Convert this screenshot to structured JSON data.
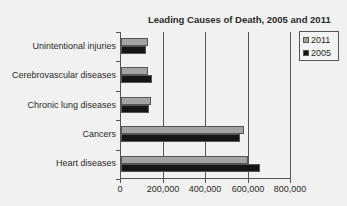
{
  "chart_data": {
    "type": "bar",
    "orientation": "horizontal",
    "title": "Leading Causes of Death, 2005 and 2011",
    "xlabel": "",
    "ylabel": "",
    "categories": [
      "Unintentional injuries",
      "Cerebrovascular diseases",
      "Chronic lung diseases",
      "Cancers",
      "Heart diseases"
    ],
    "series": [
      {
        "name": "2011",
        "color": "#a3a3a3",
        "values": [
          126000,
          129000,
          143000,
          577000,
          597000
        ]
      },
      {
        "name": "2005",
        "color": "#151515",
        "values": [
          118000,
          144000,
          131000,
          559000,
          652000
        ]
      }
    ],
    "xlim": [
      0,
      800000
    ],
    "x_ticks": [
      "0",
      "200,000",
      "400,000",
      "600,000",
      "800,000"
    ],
    "grid": "vertical",
    "legend_position": "top-right"
  },
  "legend": {
    "items": [
      {
        "label": "2011"
      },
      {
        "label": "2005"
      }
    ]
  }
}
